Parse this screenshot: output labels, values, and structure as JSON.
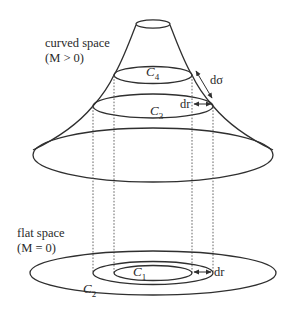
{
  "figure": {
    "type": "diagram",
    "colors": {
      "line": "#2f2f2f",
      "text": "#2a2a2a",
      "background": "#ffffff"
    }
  },
  "labels": {
    "curved_space": "curved space",
    "curved_condition": "(M > 0)",
    "flat_space": "flat space",
    "flat_condition": "(M = 0)"
  },
  "circles": {
    "c4": {
      "symbol": "C",
      "subscript": "4"
    },
    "c3": {
      "symbol": "C",
      "subscript": "3"
    },
    "c2": {
      "symbol": "C",
      "subscript": "2"
    },
    "c1": {
      "symbol": "C",
      "subscript": "1"
    }
  },
  "measures": {
    "dsigma": "dσ",
    "dr_curved": "dr",
    "dr_flat": "dr"
  }
}
